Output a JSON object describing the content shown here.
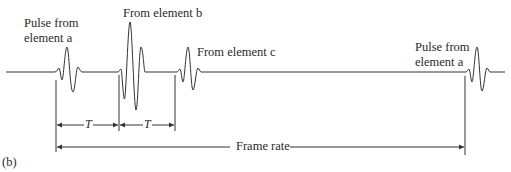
{
  "diagram": {
    "panel_label": "(b)",
    "labels": {
      "pulse_a_left_line1": "Pulse from",
      "pulse_a_left_line2": "element a",
      "element_b": "From element b",
      "element_c": "From element c",
      "pulse_a_right_line1": "Pulse from",
      "pulse_a_right_line2": "element a"
    },
    "intervals": {
      "t1": "T",
      "t2": "T",
      "frame": "Frame rate"
    },
    "line_color": "#333333"
  }
}
